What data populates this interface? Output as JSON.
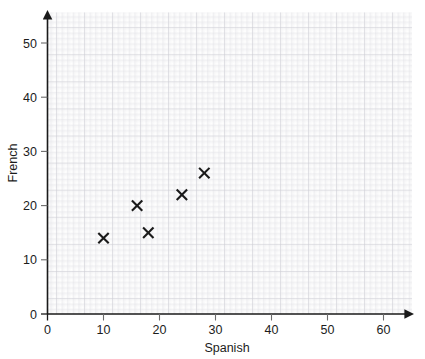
{
  "chart_data": {
    "type": "scatter",
    "title": "",
    "xlabel": "Spanish",
    "ylabel": "French",
    "xlim": [
      0,
      65
    ],
    "ylim": [
      0,
      54
    ],
    "xticks": [
      0,
      10,
      20,
      30,
      40,
      50,
      60
    ],
    "yticks": [
      0,
      10,
      20,
      30,
      40,
      50
    ],
    "xticklabels": [
      "0",
      "10",
      "20",
      "30",
      "40",
      "50",
      "60"
    ],
    "yticklabels": [
      "0",
      "10",
      "20",
      "30",
      "40",
      "50"
    ],
    "grid": true,
    "grid_minor_step": 0.2,
    "grid_major_step": 1,
    "grid_bold_step": 5,
    "legend": null,
    "marker": "x",
    "marker_color": "#1a1a1a",
    "grid_color": "#d9d9de",
    "grid_minor_color": "#ececf0",
    "axis_color": "#1a1a1a",
    "points": [
      {
        "x": 10,
        "y": 14
      },
      {
        "x": 16,
        "y": 20
      },
      {
        "x": 18,
        "y": 15
      },
      {
        "x": 24,
        "y": 22
      },
      {
        "x": 28,
        "y": 26
      }
    ],
    "series": [
      {
        "name": "Spanish vs French scores",
        "x": [
          10,
          16,
          18,
          24,
          28
        ],
        "y": [
          14,
          20,
          15,
          22,
          26
        ]
      }
    ]
  },
  "axes": {
    "x_axis_label": "Spanish",
    "y_axis_label": "French"
  }
}
